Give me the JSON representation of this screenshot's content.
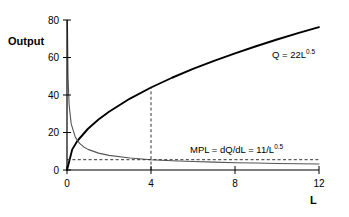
{
  "chart_data": {
    "type": "line",
    "title": "",
    "xlabel": "L",
    "ylabel": "Output",
    "xlim": [
      0,
      12
    ],
    "ylim": [
      0,
      80
    ],
    "grid": false,
    "legend": "inline-annotations",
    "x_ticks": [
      "0",
      "4",
      "8",
      "12"
    ],
    "x_tick_values": [
      0,
      4,
      8,
      12
    ],
    "y_ticks": [
      "0",
      "20",
      "40",
      "60",
      "80"
    ],
    "y_tick_values": [
      0,
      20,
      40,
      60,
      80
    ],
    "series": [
      {
        "name": "Q = 22L^0.5",
        "label_main": "Q = 22L",
        "label_exponent": "0.5",
        "formula": "Q = 22*L^0.5",
        "color": "#000000",
        "x": [
          0,
          0.25,
          0.5,
          1,
          1.5,
          2,
          3,
          4,
          5,
          6,
          7,
          8,
          9,
          10,
          11,
          12
        ],
        "values": [
          0,
          11,
          15.6,
          22,
          26.9,
          31.1,
          38.1,
          44,
          49.2,
          53.9,
          58.2,
          62.2,
          66,
          69.6,
          73,
          76.2
        ]
      },
      {
        "name": "MPL = dQ/dL = 11/L^0.5",
        "label_main": "MPL = dQ/dL = 11/L",
        "label_exponent": "0.5",
        "formula": "MPL = 11/L^0.5",
        "color": "#555555",
        "x": [
          0.019,
          0.05,
          0.1,
          0.2,
          0.4,
          0.6,
          0.8,
          1,
          1.5,
          2,
          3,
          4,
          5,
          6,
          7,
          8,
          9,
          10,
          11,
          12
        ],
        "values": [
          79.8,
          49.2,
          34.8,
          24.6,
          17.4,
          14.2,
          12.3,
          11,
          9.0,
          7.8,
          6.4,
          5.5,
          4.9,
          4.5,
          4.2,
          3.9,
          3.7,
          3.5,
          3.3,
          3.2
        ]
      }
    ],
    "annotations": [
      {
        "name": "production-function-label",
        "text": "Q = 22L",
        "exponent": "0.5",
        "x_px": 272,
        "y_px": 58
      },
      {
        "name": "mpl-label",
        "text": "MPL = dQ/dL = 11/L",
        "exponent": "0.5",
        "x_px": 190,
        "y_px": 153
      }
    ],
    "reference_lines": [
      {
        "name": "vertical-dashed-at-L4",
        "orientation": "vertical",
        "x_value": 4,
        "y_from": 0,
        "y_to": 44,
        "style": "dashed"
      },
      {
        "name": "horizontal-dashed-mpl-at-L4",
        "orientation": "horizontal",
        "y_value": 5.5,
        "x_from": 0,
        "x_to": 12,
        "style": "dashed"
      }
    ]
  },
  "axes": {
    "y_axis_title": "Output",
    "x_axis_title": "L"
  },
  "colors": {
    "background": "#ffffff",
    "axis": "#000000",
    "q_curve": "#000000",
    "mpl_curve": "#555555",
    "dashed": "#333333"
  }
}
